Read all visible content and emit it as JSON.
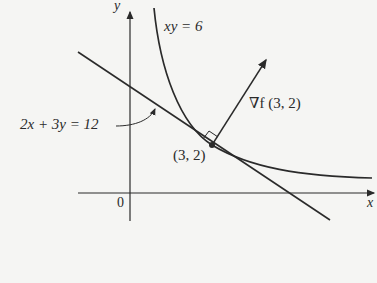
{
  "diagram": {
    "y_axis_label": "y",
    "x_axis_label": "x",
    "origin_label": "0",
    "curve_label": "xy = 6",
    "line_label": "2x + 3y = 12",
    "point_label": "(3, 2)",
    "gradient_label": "∇f (3, 2)",
    "colors": {
      "ink": "#2a2a2a",
      "background": "#f5f5f3"
    }
  }
}
